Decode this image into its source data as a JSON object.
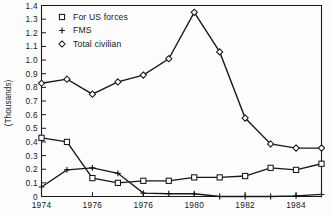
{
  "chart_data": {
    "type": "line",
    "title": "",
    "xlabel": "",
    "ylabel": "(Thousands)",
    "grid": false,
    "legend_position": "top-left",
    "x": [
      1974,
      1975,
      1976,
      1977,
      1978,
      1979,
      1980,
      1981,
      1982,
      1983,
      1984,
      1985
    ],
    "xlim": [
      1974,
      1985
    ],
    "ylim": [
      0,
      1.4
    ],
    "ytick_labels": [
      "0",
      "0.1",
      "0.2",
      "0.3",
      "0.4",
      "0.5",
      "0.6",
      "0.7",
      "0.8",
      "0.9",
      "1.0",
      "1.1",
      "1.2",
      "1.3",
      "1.4"
    ],
    "ytick_values": [
      0,
      0.1,
      0.2,
      0.3,
      0.4,
      0.5,
      0.6,
      0.7,
      0.8,
      0.9,
      1.0,
      1.1,
      1.2,
      1.3,
      1.4
    ],
    "xtick_labels": [
      "1974",
      "1976",
      "1976",
      "1980",
      "1982",
      "1984"
    ],
    "xtick_values": [
      1974,
      1976,
      1978,
      1980,
      1982,
      1984
    ],
    "series": [
      {
        "name": "For US forces",
        "marker": "square",
        "values": [
          0.43,
          0.4,
          0.135,
          0.1,
          0.115,
          0.115,
          0.14,
          0.14,
          0.15,
          0.21,
          0.195,
          0.24
        ]
      },
      {
        "name": "FMS",
        "marker": "plus",
        "values": [
          0.07,
          0.195,
          0.21,
          0.17,
          0.025,
          0.02,
          0.02,
          0.0,
          0.0,
          0.0,
          0.005,
          0.015
        ]
      },
      {
        "name": "Total civilian",
        "marker": "diamond",
        "values": [
          0.83,
          0.86,
          0.75,
          0.84,
          0.89,
          1.01,
          1.35,
          1.06,
          0.575,
          0.385,
          0.355,
          0.355
        ]
      }
    ]
  },
  "legend": {
    "items": [
      {
        "label": "For US forces",
        "marker": "square"
      },
      {
        "label": "FMS",
        "marker": "plus"
      },
      {
        "label": "Total civilian",
        "marker": "diamond"
      }
    ]
  },
  "colors": {
    "ink": "#16171b",
    "background": "#fdfdfd",
    "marker_fill": "#ffffff"
  }
}
